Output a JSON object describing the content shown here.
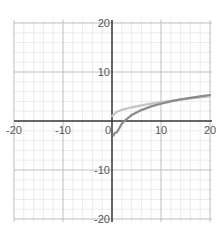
{
  "chart_data": {
    "type": "line",
    "title": "",
    "xlabel": "",
    "ylabel": "",
    "xlim": [
      -20.5,
      20.5
    ],
    "ylim": [
      -20.5,
      20.5
    ],
    "grid": true,
    "grid_minor_step": 2,
    "grid_major_step": 10,
    "x_ticks": [
      -20,
      -10,
      0,
      10,
      20
    ],
    "y_ticks": [
      20,
      10,
      -10,
      -20
    ],
    "x_tick_labels": [
      "-20",
      "-10",
      "0",
      "10",
      "20"
    ],
    "y_tick_labels": [
      "20",
      "10",
      "-10",
      "-20"
    ],
    "series": [
      {
        "name": "light curve",
        "color": "#c4c4c4",
        "x": [
          0,
          1,
          2,
          4,
          6,
          8,
          10,
          12,
          14,
          16,
          18,
          20
        ],
        "values": [
          1.0,
          1.9,
          2.27,
          2.8,
          3.2,
          3.55,
          3.85,
          4.12,
          4.37,
          4.6,
          4.82,
          5.0
        ]
      },
      {
        "name": "dark curve",
        "color": "#8a8a8a",
        "x": [
          0.3,
          0.5,
          1,
          2,
          2.5,
          4,
          6,
          8,
          10,
          12,
          14,
          16,
          18,
          20
        ],
        "values": [
          -3.0,
          -2.5,
          -2.3,
          -0.57,
          0.0,
          1.2,
          2.23,
          2.97,
          3.54,
          4.0,
          4.4,
          4.73,
          5.03,
          5.3
        ]
      }
    ]
  },
  "colors": {
    "axis": "#333333",
    "grid_minor": "#e6e6e6",
    "grid_major": "#bdbdbd",
    "label": "#555555"
  }
}
